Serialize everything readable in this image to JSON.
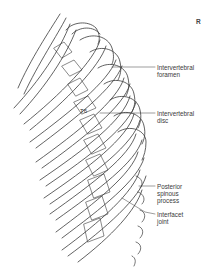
{
  "figure": {
    "orientation_marker": "R",
    "vertebra_label": "T6",
    "labels": [
      {
        "id": "intervertebral-foramen",
        "text": "Intervertebral\nforamen",
        "x": 157,
        "y": 64,
        "line": [
          [
            112,
            67
          ],
          [
            155,
            67
          ]
        ]
      },
      {
        "id": "intervertebral-disc",
        "text": "Intervertebral\ndisc",
        "x": 157,
        "y": 111,
        "line": [
          [
            100,
            113
          ],
          [
            155,
            113
          ]
        ]
      },
      {
        "id": "posterior-spinous-process",
        "text": "Posterior\nspinous\nprocess",
        "x": 157,
        "y": 182,
        "line": [
          [
            139,
            186
          ],
          [
            155,
            186
          ]
        ]
      },
      {
        "id": "interfacet-joint",
        "text": "Interfacet\njoint",
        "x": 157,
        "y": 213,
        "line": [
          [
            122,
            198
          ],
          [
            145,
            212
          ],
          [
            155,
            214
          ]
        ]
      }
    ],
    "colors": {
      "line": "#333333",
      "text": "#3a3a3a",
      "background": "#ffffff"
    }
  }
}
